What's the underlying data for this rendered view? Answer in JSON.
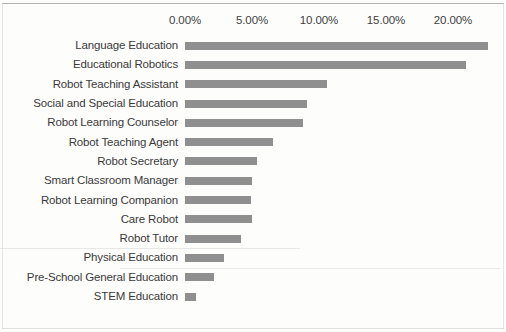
{
  "chart_data": {
    "type": "bar",
    "orientation": "horizontal",
    "title": "",
    "subtitle": "",
    "xlabel": "",
    "ylabel": "",
    "xlim": [
      0,
      22.5
    ],
    "x_tick_labels": [
      "0.00%",
      "5.00%",
      "10.00%",
      "15.00%",
      "20.00%"
    ],
    "x_tick_values": [
      0,
      5,
      10,
      15,
      20
    ],
    "grid": false,
    "legend": "none",
    "bar_color": "#8f8f8f",
    "background_color": "#fdfdfc",
    "categories": [
      "Language Education",
      "Educational Robotics",
      "Robot Teaching Assistant",
      "Social and Special Education",
      "Robot Learning Counselor",
      "Robot Teaching Agent",
      "Robot Secretary",
      "Smart Classroom Manager",
      "Robot Learning Companion",
      "Care Robot",
      "Robot Tutor",
      "Physical Education",
      "Pre-School General Education",
      "STEM Education"
    ],
    "values": [
      22.6,
      21.0,
      10.6,
      9.1,
      8.8,
      6.6,
      5.4,
      5.0,
      4.9,
      5.0,
      4.2,
      2.9,
      2.2,
      0.8
    ]
  }
}
